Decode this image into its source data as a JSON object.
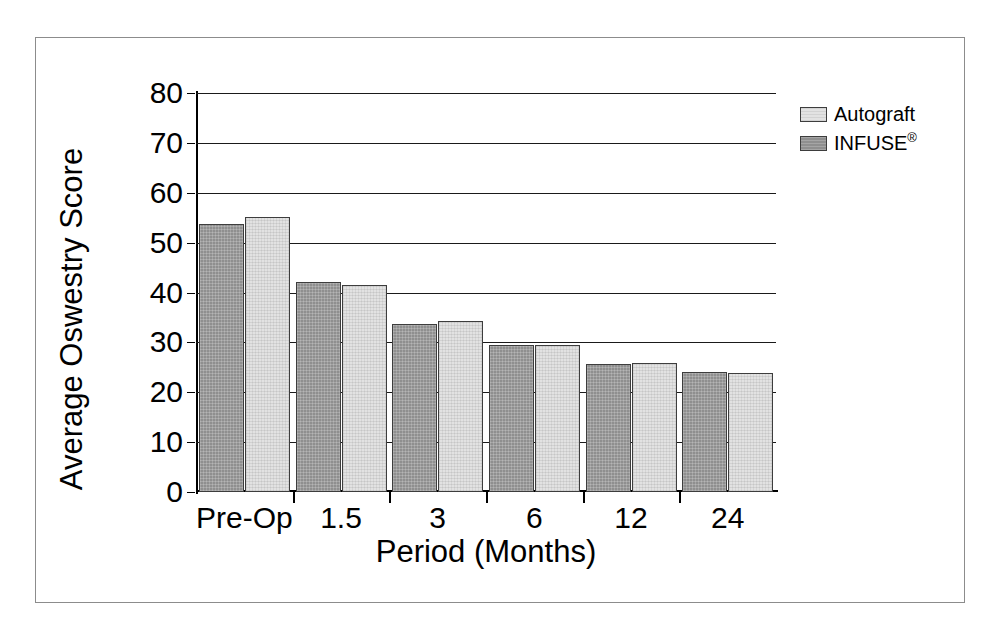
{
  "chart_data": {
    "type": "bar",
    "title": "",
    "xlabel": "Period (Months)",
    "ylabel": "Average Oswestry Score",
    "categories": [
      "Pre-Op",
      "1.5",
      "3",
      "6",
      "12",
      "24"
    ],
    "series": [
      {
        "name": "INFUSE®",
        "values": [
          53.8,
          42.2,
          33.6,
          29.4,
          25.7,
          24.0
        ],
        "fill": "#8f8f8f"
      },
      {
        "name": "Autograft",
        "values": [
          55.2,
          41.5,
          34.2,
          29.4,
          25.8,
          23.9
        ],
        "fill": "#e2e2e2"
      }
    ],
    "ylim": [
      0,
      80
    ],
    "ytick_values": [
      0,
      10,
      20,
      30,
      40,
      50,
      60,
      70,
      80
    ],
    "ytick_labels": [
      "0",
      "10",
      "20",
      "30",
      "40",
      "50",
      "60",
      "70",
      "80"
    ],
    "grid": true,
    "grid_axis": "y",
    "legend_position": "upper-right-outside",
    "legend_entries": [
      {
        "label": "Autograft",
        "label_main": "Autograft",
        "label_sup": "",
        "swatch": "autograft"
      },
      {
        "label": "INFUSE®",
        "label_main": "INFUSE",
        "label_sup": "®",
        "swatch": "infuse"
      }
    ],
    "frame_color": "#8c8c8c",
    "axis_color": "#000000",
    "background": "#ffffff"
  }
}
